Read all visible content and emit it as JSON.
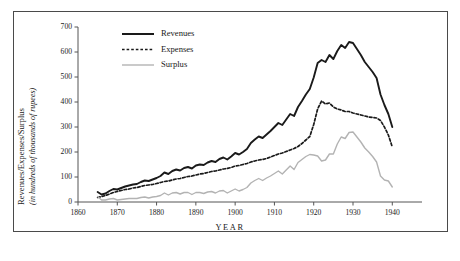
{
  "chart_data": {
    "type": "line",
    "title": "",
    "xlabel": "YEAR",
    "ylabel": "Revenues/Expenses/Surplus",
    "ylabel_sub": "(in hundreds of thousands of rupees)",
    "xlim": [
      1860,
      1944
    ],
    "ylim": [
      0,
      700
    ],
    "xticks": [
      1860,
      1870,
      1880,
      1890,
      1900,
      1910,
      1920,
      1930,
      1940
    ],
    "xtick_labels": [
      "1860",
      "1870",
      "1880",
      "1890",
      "1900",
      "1910",
      "1920",
      "1930",
      "1940"
    ],
    "yticks": [
      0,
      100,
      200,
      300,
      400,
      500,
      600,
      700
    ],
    "ytick_labels": [
      "0",
      "100",
      "200",
      "300",
      "400",
      "500",
      "600",
      "700"
    ],
    "grid": false,
    "legend_position": "top-center",
    "x": [
      1865,
      1866,
      1867,
      1868,
      1869,
      1870,
      1871,
      1872,
      1873,
      1874,
      1875,
      1876,
      1877,
      1878,
      1879,
      1880,
      1881,
      1882,
      1883,
      1884,
      1885,
      1886,
      1887,
      1888,
      1889,
      1890,
      1891,
      1892,
      1893,
      1894,
      1895,
      1896,
      1897,
      1898,
      1899,
      1900,
      1901,
      1902,
      1903,
      1904,
      1905,
      1906,
      1907,
      1908,
      1909,
      1910,
      1911,
      1912,
      1913,
      1914,
      1915,
      1916,
      1917,
      1918,
      1919,
      1920,
      1921,
      1922,
      1923,
      1924,
      1925,
      1926,
      1927,
      1928,
      1929,
      1930,
      1931,
      1932,
      1933,
      1934,
      1935,
      1936,
      1937,
      1938,
      1939,
      1940
    ],
    "series": [
      {
        "name": "Revenues",
        "color": "#1a1a1a",
        "style": "solid",
        "width": 1.9,
        "values": [
          40,
          30,
          34,
          44,
          52,
          50,
          56,
          62,
          66,
          70,
          72,
          80,
          86,
          84,
          90,
          96,
          104,
          118,
          112,
          124,
          130,
          126,
          136,
          140,
          134,
          146,
          150,
          148,
          158,
          164,
          160,
          172,
          178,
          170,
          182,
          196,
          190,
          200,
          212,
          236,
          250,
          262,
          256,
          270,
          284,
          300,
          316,
          308,
          330,
          352,
          344,
          380,
          404,
          430,
          452,
          498,
          556,
          568,
          560,
          588,
          572,
          604,
          628,
          616,
          640,
          636,
          612,
          588,
          560,
          540,
          520,
          496,
          430,
          388,
          352,
          300
        ]
      },
      {
        "name": "Expenses",
        "color": "#1a1a1a",
        "style": "dotted",
        "width": 1.7,
        "values": [
          18,
          22,
          26,
          32,
          38,
          42,
          46,
          50,
          52,
          56,
          58,
          62,
          66,
          68,
          70,
          74,
          78,
          82,
          84,
          88,
          92,
          94,
          98,
          102,
          104,
          108,
          112,
          114,
          118,
          122,
          124,
          128,
          132,
          134,
          138,
          144,
          146,
          150,
          154,
          160,
          164,
          168,
          170,
          174,
          180,
          186,
          192,
          196,
          202,
          208,
          214,
          222,
          234,
          248,
          262,
          310,
          372,
          404,
          392,
          396,
          380,
          372,
          368,
          362,
          362,
          356,
          352,
          348,
          344,
          340,
          338,
          336,
          326,
          300,
          268,
          220
        ]
      },
      {
        "name": "Surplus",
        "color": "#b3b3b3",
        "style": "solid",
        "width": 1.4,
        "values": [
          22,
          8,
          8,
          12,
          14,
          8,
          10,
          12,
          14,
          14,
          14,
          18,
          20,
          16,
          20,
          22,
          26,
          36,
          28,
          36,
          38,
          32,
          38,
          38,
          30,
          38,
          38,
          34,
          40,
          42,
          36,
          44,
          46,
          36,
          44,
          52,
          44,
          50,
          58,
          76,
          86,
          94,
          86,
          96,
          104,
          114,
          124,
          112,
          128,
          144,
          130,
          158,
          170,
          182,
          190,
          188,
          184,
          164,
          168,
          192,
          192,
          232,
          260,
          254,
          278,
          280,
          260,
          240,
          216,
          200,
          182,
          160,
          104,
          88,
          84,
          60
        ]
      }
    ],
    "legend": [
      {
        "label": "Revenues",
        "style": "solid",
        "color": "#1a1a1a"
      },
      {
        "label": "Expenses",
        "style": "dotted",
        "color": "#1a1a1a"
      },
      {
        "label": "Surplus",
        "style": "solid",
        "color": "#b3b3b3"
      }
    ]
  }
}
